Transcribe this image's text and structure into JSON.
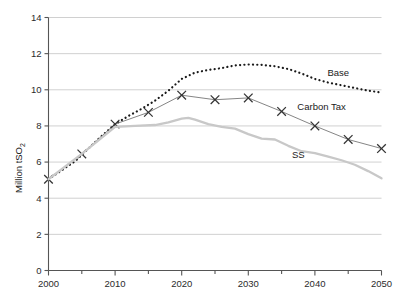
{
  "chart_data": {
    "type": "line",
    "title": "",
    "xlabel": "",
    "ylabel": "Million tSO2",
    "ylabel_main": "Million tSO",
    "ylabel_sub": "2",
    "xlim": [
      2000,
      2050
    ],
    "ylim": [
      0,
      14
    ],
    "ytick_step": 2,
    "xtick_step": 10,
    "x_minor_step": 5,
    "grid": "horizontal",
    "legend_position": "inline-right",
    "xticks": [
      "2000",
      "2010",
      "2020",
      "2030",
      "2040",
      "2050"
    ],
    "yticks": [
      "0",
      "2",
      "4",
      "6",
      "8",
      "10",
      "12",
      "14"
    ],
    "series": [
      {
        "name": "Base",
        "label": "Base",
        "style": "dotted",
        "color": "#1a1a1a",
        "marker": "none",
        "label_x": 2043.5,
        "label_y": 10.95,
        "x": [
          2000,
          2002,
          2004,
          2006,
          2008,
          2010,
          2012,
          2014,
          2016,
          2018,
          2020,
          2022,
          2024,
          2026,
          2028,
          2030,
          2032,
          2034,
          2036,
          2038,
          2040,
          2042,
          2044,
          2046,
          2048,
          2050
        ],
        "values": [
          5.05,
          5.55,
          6.05,
          6.75,
          7.45,
          8.1,
          8.55,
          8.95,
          9.4,
          9.95,
          10.6,
          10.95,
          11.1,
          11.2,
          11.35,
          11.4,
          11.38,
          11.3,
          11.15,
          10.9,
          10.6,
          10.4,
          10.25,
          10.1,
          9.95,
          9.85
        ]
      },
      {
        "name": "Carbon Tax",
        "label": "Carbon Tax",
        "style": "solid",
        "color": "#777777",
        "marker": "x",
        "marker_color": "#333333",
        "label_x": 2041.0,
        "label_y": 9.05,
        "x": [
          2000,
          2005,
          2010,
          2015,
          2020,
          2025,
          2030,
          2035,
          2040,
          2045,
          2050
        ],
        "values": [
          5.05,
          6.45,
          8.1,
          8.75,
          9.7,
          9.45,
          9.55,
          8.8,
          8.0,
          7.25,
          6.75
        ]
      },
      {
        "name": "SS",
        "label": "SS",
        "style": "solid-thick",
        "color": "#c8c8c8",
        "marker": "none",
        "label_x": 2037.5,
        "label_y": 6.4,
        "x": [
          2000,
          2005,
          2010,
          2013,
          2016,
          2018,
          2020,
          2021,
          2022,
          2024,
          2026,
          2028,
          2030,
          2032,
          2034,
          2036,
          2038,
          2040,
          2042,
          2044,
          2046,
          2048,
          2050
        ],
        "values": [
          5.05,
          6.45,
          7.95,
          8.0,
          8.05,
          8.2,
          8.4,
          8.45,
          8.35,
          8.1,
          7.95,
          7.85,
          7.55,
          7.3,
          7.25,
          6.9,
          6.6,
          6.5,
          6.3,
          6.1,
          5.85,
          5.5,
          5.1
        ]
      }
    ]
  },
  "axes": {
    "y_title_main": "Million tSO",
    "y_title_sub": "2"
  }
}
